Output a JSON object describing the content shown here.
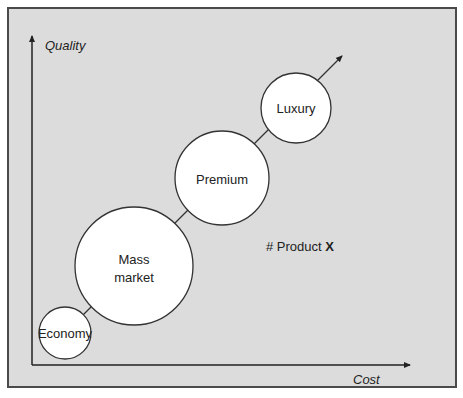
{
  "diagram": {
    "type": "positioning-map",
    "y_axis_label": "Quality",
    "x_axis_label": "Cost",
    "segments": [
      {
        "label_lines": [
          "Economy"
        ],
        "size": "small"
      },
      {
        "label_lines": [
          "Mass",
          "market"
        ],
        "size": "largest"
      },
      {
        "label_lines": [
          "Premium"
        ],
        "size": "large"
      },
      {
        "label_lines": [
          "Luxury"
        ],
        "size": "medium"
      }
    ],
    "annotation": {
      "prefix": "# Product ",
      "emphasis": "X"
    },
    "colors": {
      "background": "#dcdcdc",
      "circle_fill": "#ffffff",
      "stroke": "#333333"
    }
  }
}
